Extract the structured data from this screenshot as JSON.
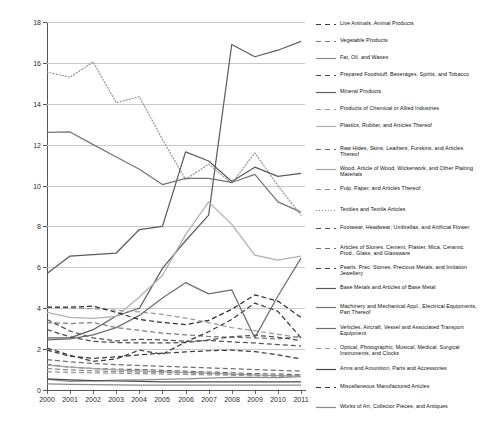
{
  "chart_data": {
    "type": "line",
    "title": "",
    "subtitle": "",
    "xlabel": "",
    "ylabel": "",
    "x": [
      2000,
      2001,
      2002,
      2003,
      2004,
      2005,
      2006,
      2007,
      2008,
      2009,
      2010,
      2011
    ],
    "xtick_labels": [
      "2000",
      "2001",
      "2002",
      "2003",
      "2004",
      "2005",
      "2006",
      "2007",
      "2008",
      "2009",
      "2010",
      "2011"
    ],
    "ytick_labels": [
      "0",
      "2",
      "4",
      "6",
      "8",
      "10",
      "12",
      "14",
      "16",
      "18"
    ],
    "yticks": [
      0,
      2,
      4,
      6,
      8,
      10,
      12,
      14,
      16,
      18
    ],
    "ylim": [
      0,
      18
    ],
    "xlim": [
      2000,
      2011
    ],
    "grid": "horizontal",
    "legend_position": "right",
    "series": [
      {
        "name": "Live Animals, Animal Products",
        "style": "dashed",
        "color": "#3a3a3a",
        "values": [
          1.95,
          1.65,
          1.55,
          1.62,
          1.72,
          1.8,
          1.86,
          1.92,
          1.95,
          1.88,
          1.72,
          1.52
        ]
      },
      {
        "name": "Vegetable Products",
        "style": "dashed",
        "color": "#7d7d7d",
        "values": [
          3.3,
          3.25,
          3.3,
          3.05,
          2.92,
          2.78,
          2.7,
          2.62,
          2.58,
          2.55,
          2.5,
          2.62
        ]
      },
      {
        "name": "Fat, Oil, and Waxes",
        "style": "solid",
        "color": "#8e8e8e",
        "values": [
          0.52,
          0.42,
          0.45,
          0.48,
          0.5,
          0.52,
          0.55,
          0.58,
          0.62,
          0.62,
          0.6,
          0.65
        ]
      },
      {
        "name": "Prepared Foodstuff, Beverages, Spirits, and Tobacco",
        "style": "dashed",
        "color": "#4b4b4b",
        "values": [
          2.95,
          2.6,
          2.38,
          2.32,
          2.3,
          2.3,
          2.32,
          2.45,
          2.6,
          2.68,
          2.58,
          2.42
        ]
      },
      {
        "name": "Mineral Products",
        "style": "solid",
        "color": "#5e5e5e",
        "values": [
          2.55,
          2.55,
          2.95,
          3.62,
          4.0,
          5.95,
          7.3,
          8.55,
          16.9,
          16.3,
          16.62,
          17.05
        ]
      },
      {
        "name": "Products of Chemical or Allied Industries",
        "style": "dashed",
        "color": "#9a9a9a",
        "values": [
          4.05,
          4.0,
          3.98,
          3.9,
          3.82,
          3.7,
          3.52,
          3.3,
          3.05,
          2.9,
          2.72,
          2.55
        ]
      },
      {
        "name": "Plastics, Rubber, and Articles Thereof",
        "style": "solid",
        "color": "#b0b0b0",
        "values": [
          3.8,
          3.55,
          3.5,
          3.6,
          4.55,
          5.6,
          7.6,
          9.2,
          8.1,
          6.6,
          6.35,
          6.55
        ]
      },
      {
        "name": "Raw Hides, Skins, Leathers, Furskins, and Articles Thereof",
        "style": "dashed",
        "color": "#6a6a6a",
        "values": [
          1.25,
          1.12,
          1.05,
          1.02,
          1.0,
          0.96,
          0.92,
          0.88,
          0.84,
          0.8,
          0.78,
          0.75
        ]
      },
      {
        "name": "Wood, Article of Wood, Wickerwork, and Other Plaiting Materials",
        "style": "solid",
        "color": "#a4a4a4",
        "values": [
          1.22,
          1.12,
          1.04,
          0.98,
          0.94,
          0.9,
          0.86,
          0.82,
          0.78,
          0.74,
          0.7,
          0.68
        ]
      },
      {
        "name": "Pulp, Paper, and Articles Thereof",
        "style": "dashed",
        "color": "#8a8a8a",
        "values": [
          1.05,
          0.98,
          0.94,
          0.9,
          0.88,
          0.86,
          0.84,
          0.8,
          0.76,
          0.72,
          0.7,
          0.68
        ]
      },
      {
        "name": "Textiles and Textile Articles",
        "style": "dotted",
        "color": "#8f8f8f",
        "values": [
          15.55,
          15.3,
          16.05,
          14.05,
          14.35,
          12.25,
          10.3,
          11.05,
          10.1,
          11.6,
          10.0,
          8.55
        ]
      },
      {
        "name": "Footwear, Headwear, Umbrellas, and Artificial Flower",
        "style": "dashed",
        "color": "#555555",
        "values": [
          3.45,
          2.88,
          2.55,
          2.4,
          2.48,
          2.45,
          2.38,
          2.42,
          2.35,
          2.3,
          2.22,
          2.15
        ]
      },
      {
        "name": "Articles of Stones, Cement, Plaster, Mica, Ceramic Prod., Glass, and Glassware",
        "style": "dashed",
        "color": "#707070",
        "values": [
          1.48,
          1.38,
          1.3,
          1.24,
          1.2,
          1.16,
          1.12,
          1.08,
          1.04,
          1.0,
          0.96,
          0.92
        ]
      },
      {
        "name": "Pearls, Prec. Stones, Precious Metals, and Imitation Jewellery",
        "style": "dashed",
        "color": "#3d3d3d",
        "values": [
          2.05,
          1.7,
          1.4,
          1.52,
          1.95,
          1.75,
          2.35,
          2.85,
          3.45,
          4.25,
          3.85,
          2.55
        ]
      },
      {
        "name": "Base Metals and Articles of Base Metal",
        "style": "solid",
        "color": "#5a5a5a",
        "values": [
          5.7,
          6.55,
          6.62,
          6.7,
          7.85,
          8.0,
          11.65,
          11.2,
          10.2,
          10.9,
          10.45,
          10.6
        ]
      },
      {
        "name": "Machinery and Mechanical Appl., Electrical Equipments, Part Thereof",
        "style": "solid",
        "color": "#747474",
        "values": [
          12.6,
          12.62,
          12.0,
          11.4,
          10.8,
          10.05,
          10.35,
          10.35,
          10.15,
          10.55,
          9.2,
          8.7
        ]
      },
      {
        "name": "Vehicles, Aircraft, Vessel and Associated Transport Equipment",
        "style": "solid",
        "color": "#6e6e6e",
        "values": [
          2.45,
          2.5,
          2.7,
          3.05,
          3.65,
          4.5,
          5.25,
          4.7,
          4.9,
          2.55,
          4.6,
          6.45
        ]
      },
      {
        "name": "Optical, Photographic, Musical, Medical, Surgical Instruments, and Clocks",
        "style": "dashed",
        "color": "#999999",
        "values": [
          0.9,
          0.86,
          0.84,
          0.82,
          0.8,
          0.78,
          0.76,
          0.74,
          0.72,
          0.7,
          0.68,
          0.66
        ]
      },
      {
        "name": "Arms and Amunition, Parts and Accessories",
        "style": "solid",
        "color": "#4a4a4a",
        "values": [
          0.55,
          0.5,
          0.46,
          0.44,
          0.42,
          0.4,
          0.4,
          0.4,
          0.4,
          0.4,
          0.4,
          0.4
        ]
      },
      {
        "name": "Miscellaneous Manufactured Articles",
        "style": "dashed",
        "color": "#2f2f2f",
        "values": [
          4.05,
          4.05,
          4.1,
          3.8,
          3.45,
          3.3,
          3.2,
          3.4,
          3.95,
          4.65,
          4.35,
          3.55
        ]
      },
      {
        "name": "Works of Art, Collector Pieces, and Antiques",
        "style": "solid",
        "color": "#8c8c8c",
        "values": [
          0.3,
          0.28,
          0.26,
          0.25,
          0.24,
          0.24,
          0.24,
          0.24,
          0.24,
          0.24,
          0.24,
          0.24
        ]
      }
    ]
  },
  "legend": {
    "entries": [
      {
        "label": "Live Animals, Animal Products"
      },
      {
        "label": "Vegetable Products"
      },
      {
        "label": "Fat, Oil, and Waxes"
      },
      {
        "label": "Prepared Foodstuff, Beverages, Spirits, and Tobacco"
      },
      {
        "label": "Mineral Products"
      },
      {
        "label": "Products of Chemical or Allied Industries"
      },
      {
        "label": "Plastics, Rubber, and Articles Thereof"
      },
      {
        "label": "Raw Hides, Skins, Leathers, Furskins, and Articles Thereof"
      },
      {
        "label": "Wood, Article of Wood, Wickerwork, and Other Plaiting Materials"
      },
      {
        "label": "Pulp, Paper, and Articles Thereof"
      },
      {
        "label": "Textiles and Textile Articles"
      },
      {
        "label": "Footwear, Headwear, Umbrellas, and Artificial Flower"
      },
      {
        "label": "Articles of Stones, Cement, Plaster, Mica, Ceramic Prod., Glass, and Glassware"
      },
      {
        "label": "Pearls, Prec. Stones, Precious Metals, and Imitation Jewellery"
      },
      {
        "label": "Base Metals and Articles of Base Metal"
      },
      {
        "label": "Machinery and Mechanical Appl., Electrical Equipments, Part Thereof"
      },
      {
        "label": "Vehicles, Aircraft, Vessel and Associated Transport Equipment"
      },
      {
        "label": "Optical, Photographic, Musical, Medical, Surgical Instruments, and Clocks"
      },
      {
        "label": "Arms and Amunition, Parts and Accessories"
      },
      {
        "label": "Miscellaneous Manufactured Articles"
      },
      {
        "label": "Works of Art, Collector Pieces, and Antiques"
      }
    ]
  },
  "colors": {
    "axis": "#555555",
    "grid": "#c9c9c9",
    "background": "#ffffff",
    "text": "#1a1a1a"
  }
}
